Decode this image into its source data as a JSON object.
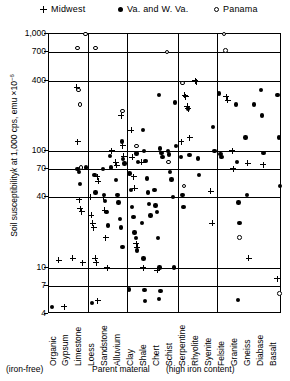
{
  "legend": {
    "items": [
      {
        "label": "Midwest",
        "marker": "plus-icon"
      },
      {
        "label": "Va. and  W. Va.",
        "marker": "filled-circle-icon"
      },
      {
        "label": "Panama",
        "marker": "open-circle-icon"
      }
    ]
  },
  "axes": {
    "ylabel_main": "Soil susceptibility",
    "ylabel_k": "k",
    "ylabel_rest": " at 1,000 cps,  emu  ×10",
    "ylabel_exp": "−6",
    "yticks": [
      "1,000",
      "700",
      "400",
      "100",
      "70",
      "40",
      "10",
      "7",
      "4"
    ]
  },
  "xgroups": [
    "(iron-free)",
    "Parent  material",
    "(high iron content)"
  ],
  "chart_data": {
    "type": "scatter",
    "title": "",
    "xlabel": "Parent material",
    "ylabel": "Soil susceptibility k at 1,000 cps, emu ×10⁻⁶",
    "yscale": "log",
    "ylim": [
      4,
      1000
    ],
    "ytick_values": [
      1000,
      700,
      400,
      100,
      70,
      40,
      10,
      7,
      4
    ],
    "grid": true,
    "legend_position": "top",
    "categories": [
      "Organic",
      "Gypsum",
      "Limestone",
      "Loess",
      "Sandstone",
      "Alluvium",
      "Clay",
      "Shale",
      "Chert",
      "Schist",
      "Serpentine",
      "Rhyolite",
      "Syenite",
      "Felsite",
      "Granite",
      "Gneiss",
      "Diabase",
      "Basalt"
    ],
    "group_dividers_after": [
      "Limestone",
      "Alluvium",
      "Schist",
      "Syenite"
    ],
    "series": [
      {
        "name": "Midwest",
        "marker": "plus",
        "points": [
          {
            "cat": "Limestone",
            "y": 350
          },
          {
            "cat": "Limestone",
            "y": 120
          },
          {
            "cat": "Limestone",
            "y": 38
          },
          {
            "cat": "Limestone",
            "y": 32
          },
          {
            "cat": "Limestone",
            "y": 30
          },
          {
            "cat": "Limestone",
            "y": 11
          },
          {
            "cat": "Loess",
            "y": 60
          },
          {
            "cat": "Loess",
            "y": 55
          },
          {
            "cat": "Loess",
            "y": 40
          },
          {
            "cat": "Loess",
            "y": 28
          },
          {
            "cat": "Loess",
            "y": 24
          },
          {
            "cat": "Loess",
            "y": 22
          },
          {
            "cat": "Loess",
            "y": 12
          },
          {
            "cat": "Loess",
            "y": 11
          },
          {
            "cat": "Loess",
            "y": 5.2
          },
          {
            "cat": "Sandstone",
            "y": 100
          },
          {
            "cat": "Sandstone",
            "y": 40
          },
          {
            "cat": "Sandstone",
            "y": 31
          },
          {
            "cat": "Sandstone",
            "y": 18
          },
          {
            "cat": "Sandstone",
            "y": 10
          },
          {
            "cat": "Alluvium",
            "y": 200
          },
          {
            "cat": "Alluvium",
            "y": 110
          },
          {
            "cat": "Alluvium",
            "y": 90
          },
          {
            "cat": "Alluvium",
            "y": 80
          },
          {
            "cat": "Alluvium",
            "y": 75
          },
          {
            "cat": "Clay",
            "y": 150
          },
          {
            "cat": "Clay",
            "y": 88
          },
          {
            "cat": "Clay",
            "y": 60
          },
          {
            "cat": "Clay",
            "y": 48
          },
          {
            "cat": "Clay",
            "y": 16
          },
          {
            "cat": "Clay",
            "y": 15
          },
          {
            "cat": "Shale",
            "y": 80
          },
          {
            "cat": "Shale",
            "y": 10
          },
          {
            "cat": "Chert",
            "y": 9.5
          },
          {
            "cat": "Serpentine",
            "y": 300
          },
          {
            "cat": "Serpentine",
            "y": 290
          },
          {
            "cat": "Serpentine",
            "y": 240
          },
          {
            "cat": "Serpentine",
            "y": 230
          },
          {
            "cat": "Serpentine",
            "y": 130
          },
          {
            "cat": "Serpentine",
            "y": 120
          },
          {
            "cat": "Rhyolite",
            "y": 400
          },
          {
            "cat": "Rhyolite",
            "y": 390
          },
          {
            "cat": "Syenite",
            "y": 45
          },
          {
            "cat": "Syenite",
            "y": 24
          },
          {
            "cat": "Felsite",
            "y": 290
          },
          {
            "cat": "Felsite",
            "y": 270
          },
          {
            "cat": "Granite",
            "y": 100
          },
          {
            "cat": "Granite",
            "y": 70
          },
          {
            "cat": "Gneiss",
            "y": 78
          },
          {
            "cat": "Gneiss",
            "y": 12
          },
          {
            "cat": "Diabase",
            "y": 76
          },
          {
            "cat": "Basalt",
            "y": 8
          },
          {
            "cat": "Organic",
            "y": 11.5
          },
          {
            "cat": "Gypsum",
            "y": 12
          },
          {
            "cat": "Gypsum",
            "y": 4.6
          }
        ]
      },
      {
        "name": "Va. and W. Va.",
        "marker": "filled-circle",
        "points": [
          {
            "cat": "Limestone",
            "y": 72
          },
          {
            "cat": "Limestone",
            "y": 70
          },
          {
            "cat": "Limestone",
            "y": 66
          },
          {
            "cat": "Limestone",
            "y": 52
          },
          {
            "cat": "Loess",
            "y": 62
          },
          {
            "cat": "Loess",
            "y": 44
          },
          {
            "cat": "Sandstone",
            "y": 90
          },
          {
            "cat": "Sandstone",
            "y": 72
          },
          {
            "cat": "Sandstone",
            "y": 70
          },
          {
            "cat": "Sandstone",
            "y": 42
          },
          {
            "cat": "Sandstone",
            "y": 37
          },
          {
            "cat": "Sandstone",
            "y": 30
          },
          {
            "cat": "Sandstone",
            "y": 23
          },
          {
            "cat": "Alluvium",
            "y": 120
          },
          {
            "cat": "Alluvium",
            "y": 85
          },
          {
            "cat": "Alluvium",
            "y": 78
          },
          {
            "cat": "Alluvium",
            "y": 56
          },
          {
            "cat": "Alluvium",
            "y": 42
          },
          {
            "cat": "Alluvium",
            "y": 36
          },
          {
            "cat": "Alluvium",
            "y": 26
          },
          {
            "cat": "Alluvium",
            "y": 22
          },
          {
            "cat": "Alluvium",
            "y": 15
          },
          {
            "cat": "Clay",
            "y": 95
          },
          {
            "cat": "Clay",
            "y": 80
          },
          {
            "cat": "Clay",
            "y": 64
          },
          {
            "cat": "Clay",
            "y": 46
          },
          {
            "cat": "Clay",
            "y": 33
          },
          {
            "cat": "Clay",
            "y": 27
          },
          {
            "cat": "Clay",
            "y": 20
          },
          {
            "cat": "Clay",
            "y": 18
          },
          {
            "cat": "Clay",
            "y": 14
          },
          {
            "cat": "Clay",
            "y": 6.5
          },
          {
            "cat": "Shale",
            "y": 150
          },
          {
            "cat": "Shale",
            "y": 100
          },
          {
            "cat": "Shale",
            "y": 82
          },
          {
            "cat": "Shale",
            "y": 58
          },
          {
            "cat": "Shale",
            "y": 44
          },
          {
            "cat": "Shale",
            "y": 35
          },
          {
            "cat": "Shale",
            "y": 28
          },
          {
            "cat": "Shale",
            "y": 24
          },
          {
            "cat": "Shale",
            "y": 12
          },
          {
            "cat": "Shale",
            "y": 6.4
          },
          {
            "cat": "Chert",
            "y": 300
          },
          {
            "cat": "Chert",
            "y": 105
          },
          {
            "cat": "Chert",
            "y": 96
          },
          {
            "cat": "Chert",
            "y": 88
          },
          {
            "cat": "Chert",
            "y": 46
          },
          {
            "cat": "Chert",
            "y": 34
          },
          {
            "cat": "Chert",
            "y": 30
          },
          {
            "cat": "Chert",
            "y": 18
          },
          {
            "cat": "Chert",
            "y": 10
          },
          {
            "cat": "Chert",
            "y": 6.3
          },
          {
            "cat": "Schist",
            "y": 260
          },
          {
            "cat": "Schist",
            "y": 110
          },
          {
            "cat": "Schist",
            "y": 100
          },
          {
            "cat": "Schist",
            "y": 93
          },
          {
            "cat": "Schist",
            "y": 66
          },
          {
            "cat": "Schist",
            "y": 57
          },
          {
            "cat": "Schist",
            "y": 40
          },
          {
            "cat": "Schist",
            "y": 10
          },
          {
            "cat": "Serpentine",
            "y": 230
          },
          {
            "cat": "Serpentine",
            "y": 92
          },
          {
            "cat": "Serpentine",
            "y": 88
          },
          {
            "cat": "Serpentine",
            "y": 42
          },
          {
            "cat": "Serpentine",
            "y": 33
          },
          {
            "cat": "Rhyolite",
            "y": 86
          },
          {
            "cat": "Rhyolite",
            "y": 62
          },
          {
            "cat": "Syenite",
            "y": 160
          },
          {
            "cat": "Syenite",
            "y": 100
          },
          {
            "cat": "Felsite",
            "y": 310
          },
          {
            "cat": "Felsite",
            "y": 94
          },
          {
            "cat": "Felsite",
            "y": 88
          },
          {
            "cat": "Granite",
            "y": 250
          },
          {
            "cat": "Granite",
            "y": 80
          },
          {
            "cat": "Granite",
            "y": 36
          },
          {
            "cat": "Granite",
            "y": 24
          },
          {
            "cat": "Gneiss",
            "y": 250
          },
          {
            "cat": "Gneiss",
            "y": 130
          },
          {
            "cat": "Gneiss",
            "y": 42
          },
          {
            "cat": "Diabase",
            "y": 330
          },
          {
            "cat": "Diabase",
            "y": 200
          },
          {
            "cat": "Diabase",
            "y": 96
          },
          {
            "cat": "Basalt",
            "y": 300
          },
          {
            "cat": "Basalt",
            "y": 130
          },
          {
            "cat": "Basalt",
            "y": 50
          },
          {
            "cat": "Organic",
            "y": 4.6
          },
          {
            "cat": "Loess",
            "y": 5.0
          },
          {
            "cat": "Shale",
            "y": 5.2
          },
          {
            "cat": "Chert",
            "y": 5.4
          },
          {
            "cat": "Granite",
            "y": 5.3
          }
        ]
      },
      {
        "name": "Panama",
        "marker": "open-circle",
        "points": [
          {
            "cat": "Limestone",
            "y": 1000
          },
          {
            "cat": "Limestone",
            "y": 760
          },
          {
            "cat": "Limestone",
            "y": 330
          },
          {
            "cat": "Limestone",
            "y": 250
          },
          {
            "cat": "Limestone",
            "y": 72
          },
          {
            "cat": "Loess",
            "y": 760
          },
          {
            "cat": "Alluvium",
            "y": 220
          },
          {
            "cat": "Clay",
            "y": 110
          },
          {
            "cat": "Schist",
            "y": 700
          },
          {
            "cat": "Schist",
            "y": 80
          },
          {
            "cat": "Serpentine",
            "y": 380
          },
          {
            "cat": "Serpentine",
            "y": 50
          },
          {
            "cat": "Felsite",
            "y": 1000
          },
          {
            "cat": "Felsite",
            "y": 720
          },
          {
            "cat": "Granite",
            "y": 18
          },
          {
            "cat": "Basalt",
            "y": 6.0
          }
        ]
      }
    ]
  }
}
